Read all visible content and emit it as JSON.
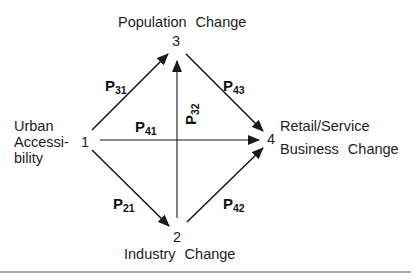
{
  "diagram": {
    "type": "path-diagram",
    "nodes": [
      {
        "id": "1",
        "number": "1",
        "label_lines": [
          "Urban",
          "Accessi-",
          "bility"
        ]
      },
      {
        "id": "2",
        "number": "2",
        "label_word1": "Industry",
        "label_word2": "Change"
      },
      {
        "id": "3",
        "number": "3",
        "label_word1": "Population",
        "label_word2": "Change"
      },
      {
        "id": "4",
        "number": "4",
        "label_line1": "Retail/Service",
        "label_line2_word1": "Business",
        "label_line2_word2": "Change"
      }
    ],
    "edges": [
      {
        "from": "1",
        "to": "3",
        "coef_letter": "P",
        "coef_sub": "31"
      },
      {
        "from": "3",
        "to": "4",
        "coef_letter": "P",
        "coef_sub": "43"
      },
      {
        "from": "1",
        "to": "4",
        "coef_letter": "P",
        "coef_sub": "41"
      },
      {
        "from": "2",
        "to": "3",
        "coef_letter": "P",
        "coef_sub": "32"
      },
      {
        "from": "1",
        "to": "2",
        "coef_letter": "P",
        "coef_sub": "21"
      },
      {
        "from": "2",
        "to": "4",
        "coef_letter": "P",
        "coef_sub": "42"
      }
    ],
    "colors": {
      "line": "#1a1a1a",
      "background": "#ffffff",
      "rule": "#555555"
    }
  }
}
